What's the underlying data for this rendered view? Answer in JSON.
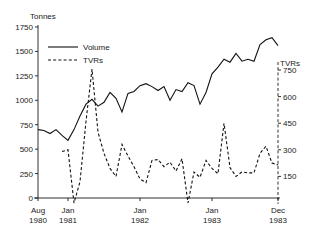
{
  "chart_data": {
    "type": "line",
    "title": "",
    "xlabel": "",
    "ylabel": "Tonnes",
    "y2label": "TVRs",
    "grid": false,
    "legend_position": "top-left",
    "x": [
      "Aug 1980",
      "Sep 1980",
      "Oct 1980",
      "Nov 1980",
      "Dec 1980",
      "Jan 1981",
      "Feb 1981",
      "Mar 1981",
      "Apr 1981",
      "May 1981",
      "Jun 1981",
      "Jul 1981",
      "Aug 1981",
      "Sep 1981",
      "Oct 1981",
      "Nov 1981",
      "Dec 1981",
      "Jan 1982",
      "Feb 1982",
      "Mar 1982",
      "Apr 1982",
      "May 1982",
      "Jun 1982",
      "Jul 1982",
      "Aug 1982",
      "Sep 1982",
      "Oct 1982",
      "Nov 1982",
      "Dec 1982",
      "Jan 1983",
      "Feb 1983",
      "Mar 1983",
      "Apr 1983",
      "May 1983",
      "Jun 1983",
      "Jul 1983",
      "Aug 1983",
      "Sep 1983",
      "Oct 1983",
      "Nov 1983",
      "Dec 1983"
    ],
    "x_tick_labels": [
      {
        "line1": "Aug",
        "line2": "1980",
        "index": 0
      },
      {
        "line1": "Jan",
        "line2": "1981",
        "index": 5
      },
      {
        "line1": "Jan",
        "line2": "1982",
        "index": 17
      },
      {
        "line1": "Jan",
        "line2": "1983",
        "index": 29
      },
      {
        "line1": "Dec",
        "line2": "1983",
        "index": 40
      }
    ],
    "ylim": [
      0,
      1750
    ],
    "yticks": [
      0,
      250,
      500,
      750,
      1000,
      1250,
      1500,
      1750
    ],
    "ytick_labels": [
      "0",
      "250",
      "500",
      "750",
      "1000",
      "1250",
      "1500",
      "1750"
    ],
    "y2lim": [
      0,
      840
    ],
    "y2ticks": [
      150,
      300,
      450,
      600,
      750
    ],
    "y2tick_labels": [
      "150",
      "300",
      "450",
      "600",
      "750"
    ],
    "series": [
      {
        "name": "Volume",
        "axis": "left",
        "style": "solid",
        "unit": "Tonnes",
        "values": [
          700,
          690,
          660,
          700,
          640,
          590,
          700,
          840,
          960,
          1010,
          940,
          980,
          1080,
          1020,
          880,
          1070,
          1090,
          1150,
          1170,
          1140,
          1100,
          1140,
          1000,
          1110,
          1090,
          1180,
          1150,
          960,
          1080,
          1270,
          1340,
          1420,
          1390,
          1480,
          1400,
          1420,
          1400,
          1570,
          1620,
          1640,
          1560
        ]
      },
      {
        "name": "TVRs",
        "axis": "right",
        "style": "dashed",
        "unit": "TVRs",
        "values": [
          null,
          null,
          null,
          null,
          290,
          300,
          0,
          120,
          460,
          755,
          400,
          280,
          195,
          150,
          330,
          265,
          205,
          135,
          115,
          240,
          245,
          205,
          230,
          180,
          250,
          0,
          175,
          145,
          240,
          195,
          165,
          450,
          200,
          150,
          175,
          170,
          170,
          280,
          320,
          225,
          215
        ]
      }
    ],
    "legend": [
      {
        "label": "Volume",
        "style": "solid"
      },
      {
        "label": "TVRs",
        "style": "dashed"
      }
    ]
  },
  "layout": {
    "plot_left": 38,
    "plot_right": 278,
    "plot_top": 27,
    "plot_bottom": 198,
    "tvrs_zero_y": 203,
    "tvrs_top_y": 70,
    "tvrs_top_value": 750
  }
}
